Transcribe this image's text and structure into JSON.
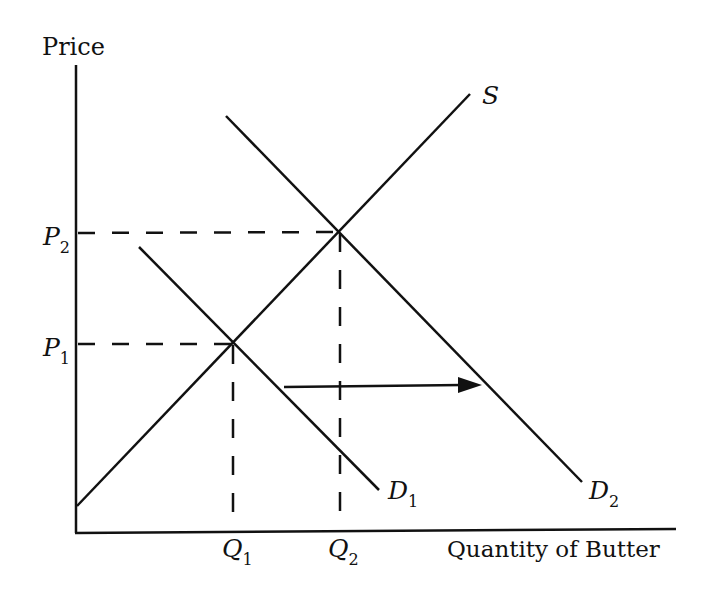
{
  "axes": {
    "y_label": "Price",
    "x_label": "Quantity of Butter"
  },
  "price_ticks": [
    {
      "base": "P",
      "sub": "2"
    },
    {
      "base": "P",
      "sub": "1"
    }
  ],
  "quantity_ticks": [
    {
      "base": "Q",
      "sub": "1"
    },
    {
      "base": "Q",
      "sub": "2"
    }
  ],
  "curves": {
    "supply": {
      "base": "S",
      "sub": ""
    },
    "demand1": {
      "base": "D",
      "sub": "1"
    },
    "demand2": {
      "base": "D",
      "sub": "2"
    }
  },
  "annotations": {
    "shift_arrow": "rightward shift of demand from D1 to D2"
  },
  "colors": {
    "line": "#111111",
    "background": "#ffffff"
  }
}
